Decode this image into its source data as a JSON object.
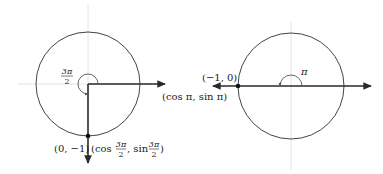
{
  "diagrams": [
    {
      "id": "left",
      "angle_label": {
        "num": "3π",
        "den": "2"
      },
      "point_label": "(0, −1)",
      "coord_label": {
        "prefix": "(cos ",
        "num1": "3π",
        "den1": "2",
        "mid": ", sin ",
        "num2": "3π",
        "den2": "2",
        "suffix": ")"
      }
    },
    {
      "id": "right",
      "angle_label": "π",
      "point_label": "(−1, 0)",
      "coord_label": "(cos π, sin π)"
    }
  ],
  "colors": {
    "line": "#2a2a2a",
    "circle": "#444444",
    "axis_faint": "#dddddd"
  }
}
